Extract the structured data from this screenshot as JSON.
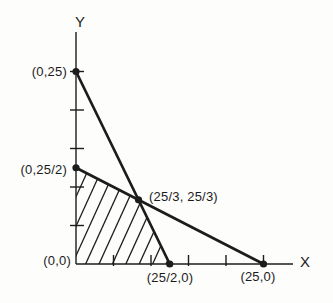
{
  "figure": {
    "background": "#fdfdfc",
    "ink_color": "#1c1c1c"
  },
  "chart_data": {
    "type": "line",
    "title": "",
    "xlabel": "X",
    "ylabel": "Y",
    "xlim": [
      0,
      29
    ],
    "ylim": [
      0,
      30
    ],
    "grid": false,
    "legend": "none",
    "x_ticks": [
      5,
      10,
      15,
      20,
      25
    ],
    "y_ticks": [
      5,
      10,
      15,
      20,
      25
    ],
    "series": [
      {
        "name": "constraint-line-1",
        "points": [
          [
            0,
            25
          ],
          [
            12.5,
            0
          ]
        ]
      },
      {
        "name": "constraint-line-2",
        "points": [
          [
            0,
            12.5
          ],
          [
            25,
            0
          ]
        ]
      }
    ],
    "marked_points": [
      [
        0,
        25
      ],
      [
        0,
        12.5
      ],
      [
        8.3333,
        8.3333
      ],
      [
        12.5,
        0
      ],
      [
        25,
        0
      ]
    ],
    "region": {
      "name": "feasible-region",
      "fill": "hatch",
      "hatch_direction": "up-right",
      "vertices": [
        [
          0,
          0
        ],
        [
          0,
          12.5
        ],
        [
          8.3333,
          8.3333
        ],
        [
          12.5,
          0
        ]
      ]
    },
    "point_labels": [
      {
        "text": "(0,25)",
        "point": [
          0,
          25
        ],
        "side": "left"
      },
      {
        "text": "(0,25/2)",
        "point": [
          0,
          12.5
        ],
        "side": "left"
      },
      {
        "text": "(25/3, 25/3)",
        "point": [
          8.3333,
          8.3333
        ],
        "side": "right"
      },
      {
        "text": "(0,0)",
        "point": [
          0,
          0
        ],
        "side": "left"
      },
      {
        "text": "(25/2,0)",
        "point": [
          12.5,
          0
        ],
        "side": "below"
      },
      {
        "text": "(25,0)",
        "point": [
          25,
          0
        ],
        "side": "below"
      }
    ],
    "axis_labels": {
      "x": "X",
      "y": "Y"
    }
  }
}
